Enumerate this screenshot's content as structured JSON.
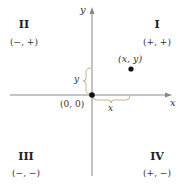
{
  "axes": {
    "x_label": "x",
    "y_label": "y"
  },
  "quadrants": [
    {
      "numeral": "II",
      "signs": "(−, +)"
    },
    {
      "numeral": "I",
      "signs": "(+, +)"
    },
    {
      "numeral": "III",
      "signs": "(−, −)"
    },
    {
      "numeral": "IV",
      "signs": "(+, −)"
    }
  ],
  "point": {
    "label": "(x, y)"
  },
  "origin": {
    "label": "(0, 0)"
  },
  "braces": {
    "x_label": "x",
    "y_label": "y"
  },
  "colors": {
    "axis": "#888888",
    "brace": "#c8b48a",
    "point": "#111111"
  }
}
